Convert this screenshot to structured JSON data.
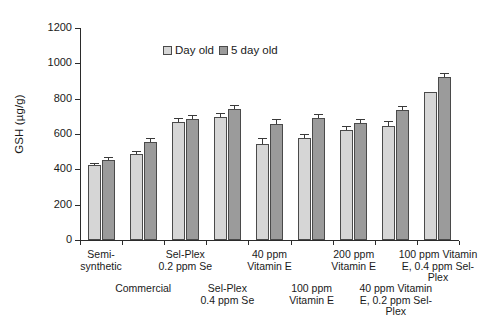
{
  "chart_data": {
    "type": "bar",
    "title": "",
    "subtitle": "",
    "xlabel": "",
    "ylabel": "GSH (µg/g)",
    "ylim": [
      0,
      1200
    ],
    "ytick_values": [
      0,
      200,
      400,
      600,
      800,
      1000,
      1200
    ],
    "ytick_labels": [
      "0",
      "200",
      "400",
      "600",
      "800",
      "1000",
      "1200"
    ],
    "grid": false,
    "legend_position": "top-center",
    "categories": [
      "Semi-\nsynthetic",
      "Commercial",
      "Sel-Plex\n0.2 ppm Se",
      "Sel-Plex\n0.4 ppm Se",
      "40 ppm\nVitamin E",
      "100 ppm\nVitamin E",
      "200 ppm\nVitamin E",
      "40 ppm Vitamin\nE, 0.2 ppm Sel-\nPlex",
      "100 ppm Vitamin\nE, 0.4 ppm Sel-\nPlex"
    ],
    "series": [
      {
        "name": "Day old",
        "color": "#d6d6d6",
        "values": [
          425,
          485,
          670,
          695,
          545,
          580,
          625,
          645,
          840
        ],
        "errors": [
          12,
          18,
          22,
          22,
          30,
          22,
          22,
          30,
          0
        ]
      },
      {
        "name": "5 day old",
        "color": "#9b9b9b",
        "values": [
          455,
          555,
          685,
          740,
          655,
          690,
          665,
          735,
          925
        ],
        "errors": [
          15,
          22,
          22,
          25,
          32,
          22,
          22,
          25,
          22
        ]
      }
    ]
  },
  "legend": {
    "items": [
      {
        "label": "Day old",
        "swatch": "light-gray-swatch"
      },
      {
        "label": "5 day old",
        "swatch": "dark-gray-swatch"
      }
    ]
  },
  "axes": {
    "y_title": "GSH (µg/g)"
  }
}
